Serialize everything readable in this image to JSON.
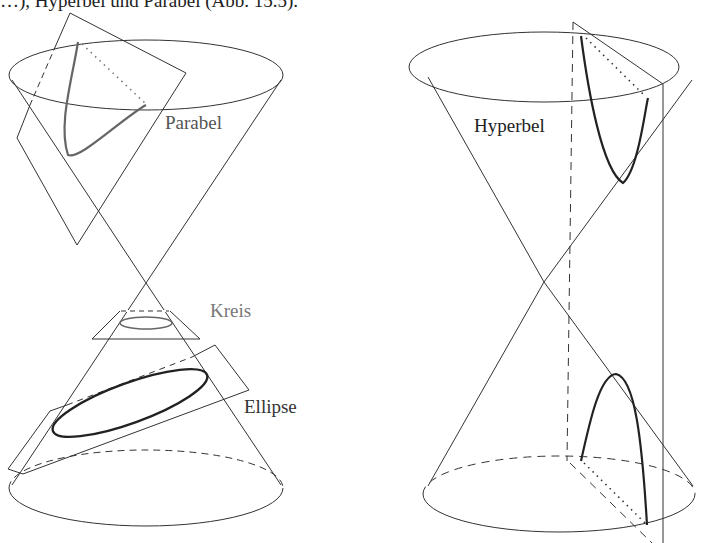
{
  "caption_fragment": "…), Hyperbel und Parabel (Abb. 15.5).",
  "labels": {
    "parabel": "Parabel",
    "kreis": "Kreis",
    "ellipse": "Ellipse",
    "hyperbel": "Hyperbel"
  },
  "figure": {
    "left_cone": {
      "sections": [
        "Parabel",
        "Kreis",
        "Ellipse"
      ]
    },
    "right_cone": {
      "sections": [
        "Hyperbel"
      ]
    }
  },
  "colors": {
    "line": "#333333",
    "curve_dark": "#222222",
    "curve_gray": "#666666",
    "label_gray": "#777777"
  }
}
